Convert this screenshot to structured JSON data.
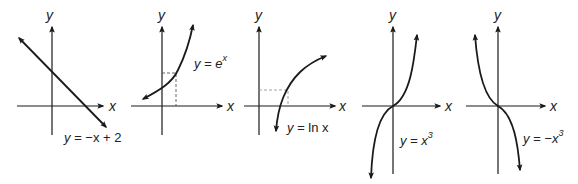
{
  "figure": {
    "graphs": [
      {
        "id": "linear",
        "y_label": "y",
        "x_label": "x",
        "eq_lhs": "y = ",
        "eq_rhs": "−x + 2",
        "eq_sup": ""
      },
      {
        "id": "exponential",
        "y_label": "y",
        "x_label": "x",
        "eq_lhs": "y = ",
        "eq_rhs": "e",
        "eq_sup": "x"
      },
      {
        "id": "logarithm",
        "y_label": "y",
        "x_label": "x",
        "eq_lhs": "y = ",
        "eq_rhs": "ln x",
        "eq_sup": ""
      },
      {
        "id": "cubic",
        "y_label": "y",
        "x_label": "x",
        "eq_lhs": "y = ",
        "eq_rhs": "x",
        "eq_sup": "3"
      },
      {
        "id": "negative-cubic",
        "y_label": "y",
        "x_label": "x",
        "eq_lhs": "y = ",
        "eq_rhs": "−x",
        "eq_sup": "3"
      }
    ]
  },
  "colors": {
    "ink": "#1a1a1a",
    "dashed": "#555555",
    "background": "#ffffff"
  }
}
